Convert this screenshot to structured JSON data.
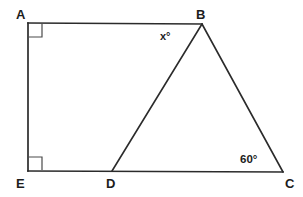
{
  "figure": {
    "kind": "geometry-diagram",
    "stroke_color": "#2b2b2b",
    "label_color": "#1c1c1c",
    "background_color": "#ffffff",
    "stroke_width": 1.6
  },
  "vertices": [
    {
      "id": "A",
      "label": "A",
      "x": 28,
      "y": 23
    },
    {
      "id": "B",
      "label": "B",
      "x": 202,
      "y": 24
    },
    {
      "id": "C",
      "label": "C",
      "x": 283,
      "y": 172
    },
    {
      "id": "D",
      "label": "D",
      "x": 112,
      "y": 171
    },
    {
      "id": "E",
      "label": "E",
      "x": 28,
      "y": 171
    }
  ],
  "segments": [
    {
      "id": "AB",
      "from": "A",
      "to": "B"
    },
    {
      "id": "AE",
      "from": "A",
      "to": "E"
    },
    {
      "id": "EC",
      "from": "E",
      "to": "C"
    },
    {
      "id": "BC",
      "from": "B",
      "to": "C"
    },
    {
      "id": "BD",
      "from": "B",
      "to": "D"
    }
  ],
  "angles": [
    {
      "id": "angle-A",
      "at": "A",
      "type": "right-angle-mark",
      "value": "90"
    },
    {
      "id": "angle-E",
      "at": "E",
      "type": "right-angle-mark",
      "value": "90"
    },
    {
      "id": "angle-ABD",
      "at": "B",
      "type": "text",
      "label": "x°"
    },
    {
      "id": "angle-BCD",
      "at": "C",
      "type": "text",
      "label": "60°"
    }
  ],
  "right_angle_marks": [
    {
      "id": "mark-A",
      "x": 28,
      "y": 23,
      "size": 14,
      "dx": 1,
      "dy": 1
    },
    {
      "id": "mark-E",
      "x": 28,
      "y": 171,
      "size": 14,
      "dx": 1,
      "dy": -1
    }
  ]
}
